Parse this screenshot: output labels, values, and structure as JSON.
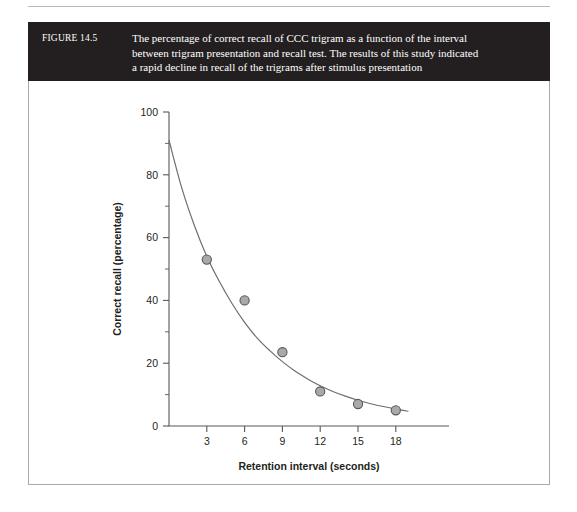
{
  "figure": {
    "number_label": "FIGURE 14.5",
    "caption_lines": [
      "The percentage of correct recall of CCC trigram as a function of the interval",
      "between trigram presentation and recall test. The results of this study indicated",
      "a rapid decline in recall of the trigrams after stimulus presentation"
    ]
  },
  "colors": {
    "caption_band": "#231f20",
    "caption_text": "#ffffff",
    "panel_border": "#a9a9a9",
    "axis": "#58585a",
    "curve": "#6d6e71",
    "marker_fill": "#a7a9ac",
    "marker_stroke": "#58585a"
  },
  "chart_data": {
    "type": "scatter",
    "title": "",
    "xlabel": "Retention interval (seconds)",
    "ylabel": "Correct recall (percentage)",
    "xlim": [
      0,
      20
    ],
    "ylim": [
      0,
      100
    ],
    "grid": false,
    "legend": "none",
    "x_ticks": [
      3,
      6,
      9,
      12,
      15,
      18
    ],
    "x_tick_labels": [
      "3",
      "6",
      "9",
      "12",
      "15",
      "18"
    ],
    "y_ticks": [
      0,
      20,
      40,
      60,
      80,
      100
    ],
    "y_tick_labels": [
      "0",
      "20",
      "40",
      "60",
      "80",
      "100"
    ],
    "y_minor_ticks": [
      10,
      30,
      50,
      70,
      90
    ],
    "x": [
      3,
      6,
      9,
      12,
      15,
      18
    ],
    "values": [
      53,
      40,
      23.5,
      11,
      7,
      5
    ],
    "series": [
      {
        "name": "Correct recall",
        "marker": "circle",
        "points": [
          {
            "x": 3,
            "y": 53
          },
          {
            "x": 6,
            "y": 40
          },
          {
            "x": 9,
            "y": 23.5
          },
          {
            "x": 12,
            "y": 11
          },
          {
            "x": 15,
            "y": 7
          },
          {
            "x": 18,
            "y": 5
          }
        ]
      }
    ],
    "fit_curve": {
      "name": "exponential decay fit",
      "description": "smooth decaying curve from about 91% at interval 0 to about 4% at interval 19",
      "points": [
        {
          "x": 0,
          "y": 91
        },
        {
          "x": 1,
          "y": 76
        },
        {
          "x": 2,
          "y": 64
        },
        {
          "x": 3,
          "y": 54
        },
        {
          "x": 4,
          "y": 46
        },
        {
          "x": 5,
          "y": 39
        },
        {
          "x": 6,
          "y": 33
        },
        {
          "x": 7,
          "y": 28
        },
        {
          "x": 8,
          "y": 24
        },
        {
          "x": 9,
          "y": 20.5
        },
        {
          "x": 10,
          "y": 17.5
        },
        {
          "x": 11,
          "y": 15
        },
        {
          "x": 12,
          "y": 12.8
        },
        {
          "x": 13,
          "y": 11
        },
        {
          "x": 14,
          "y": 9.5
        },
        {
          "x": 15,
          "y": 8.2
        },
        {
          "x": 16,
          "y": 7.1
        },
        {
          "x": 17,
          "y": 6.2
        },
        {
          "x": 18,
          "y": 5.4
        },
        {
          "x": 19,
          "y": 4.7
        }
      ]
    }
  }
}
